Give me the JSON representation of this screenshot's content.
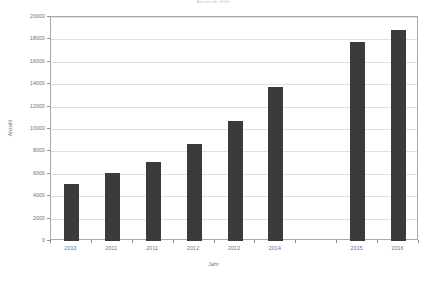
{
  "chart_data": {
    "type": "bar",
    "title": "Anzahl der Fälle",
    "xlabel": "Jahr",
    "ylabel": "Anzahl",
    "categories": [
      "2010",
      "2011",
      "2011",
      "2012",
      "2013",
      "2014",
      "2015",
      "2016"
    ],
    "values": [
      5100,
      6100,
      7050,
      8700,
      10700,
      13750,
      17800,
      18800
    ],
    "ylim": [
      0,
      20000
    ],
    "ytick_labels": [
      "0",
      "2000",
      "4000",
      "6000",
      "8000",
      "10000",
      "12000",
      "14000",
      "16000",
      "18000",
      "20000"
    ],
    "ytick_values": [
      0,
      2000,
      4000,
      6000,
      8000,
      10000,
      12000,
      14000,
      16000,
      18000,
      20000
    ],
    "grid": true,
    "legend": "none",
    "bar_color": "#3b3b3b",
    "slot_count": 9,
    "empty_slot_index": 6
  }
}
